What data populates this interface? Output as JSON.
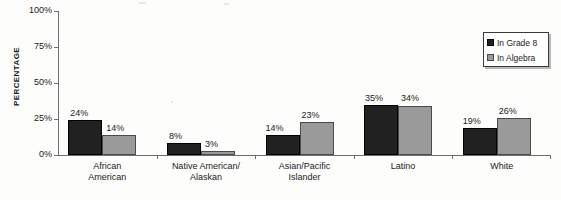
{
  "chart_data": {
    "type": "bar",
    "title": "",
    "xlabel": "",
    "ylabel": "PERCENTAGE",
    "ylim": [
      0,
      100
    ],
    "ytick_labels": [
      "0%",
      "25%",
      "50%",
      "75%",
      "100%"
    ],
    "ytick_values": [
      0,
      25,
      50,
      75,
      100
    ],
    "grid": false,
    "legend_position": "top-right",
    "categories": [
      "African American",
      "Native American/ Alaskan",
      "Asian/Pacific Islander",
      "Latino",
      "White"
    ],
    "category_lines": [
      [
        "African",
        "American"
      ],
      [
        "Native American/",
        "Alaskan"
      ],
      [
        "Asian/Pacific",
        "Islander"
      ],
      [
        "Latino"
      ],
      [
        "White"
      ]
    ],
    "series": [
      {
        "name": "In Grade 8",
        "color": "#212121",
        "values": [
          24,
          8,
          14,
          35,
          19
        ],
        "value_labels": [
          "24%",
          "8%",
          "14%",
          "35%",
          "19%"
        ]
      },
      {
        "name": "In Algebra",
        "color": "#9a9a9a",
        "values": [
          14,
          3,
          23,
          34,
          26
        ],
        "value_labels": [
          "14%",
          "3%",
          "23%",
          "34%",
          "26%"
        ]
      }
    ]
  },
  "legend": {
    "items": [
      {
        "label": "In Grade 8",
        "swatch": "black-square-icon"
      },
      {
        "label": "In Algebra",
        "swatch": "gray-square-icon"
      }
    ]
  },
  "axes": {
    "y_title": "PERCENTAGE"
  }
}
